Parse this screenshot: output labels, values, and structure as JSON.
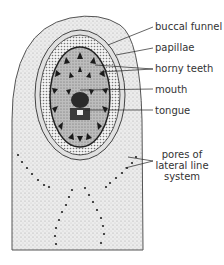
{
  "figure": {
    "labels": [
      {
        "id": "buccal-funnel",
        "text": "buccal funnel"
      },
      {
        "id": "papillae",
        "text": "papillae"
      },
      {
        "id": "horny-teeth",
        "text": "horny teeth"
      },
      {
        "id": "mouth",
        "text": "mouth"
      },
      {
        "id": "tongue",
        "text": "tongue"
      },
      {
        "id": "pores",
        "text": "pores of lateral line system",
        "lines": [
          "pores of",
          "lateral line",
          "system"
        ]
      }
    ]
  },
  "colors": {
    "ink": "#1a1a1a",
    "stipple_light": "#d8d8d8",
    "stipple_mid": "#b5b5b5",
    "disc_dark": "#3a3a3a",
    "label_text": "#333333"
  }
}
